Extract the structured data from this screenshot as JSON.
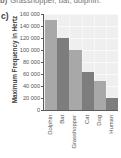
{
  "previous_item": {
    "label": "b)",
    "text": "Grasshopper, bat, dolphin."
  },
  "panel": {
    "letter": "c)"
  },
  "chart_data": {
    "type": "bar",
    "title": "",
    "xlabel": "",
    "ylabel": "Maximum Frequency in Hertz",
    "categories": [
      "Dolphin",
      "Bat",
      "Grasshopper",
      "Cat",
      "Dog",
      "Human"
    ],
    "values": [
      150000,
      120000,
      100000,
      64000,
      48000,
      20000
    ],
    "bar_colors": [
      "#a8a8a8",
      "#7d7d7d",
      "#a8a8a8",
      "#7d7d7d",
      "#a8a8a8",
      "#7d7d7d"
    ],
    "ylim": [
      0,
      160000
    ],
    "ytick_values": [
      160000,
      140000,
      120000,
      100000,
      80000,
      60000,
      40000,
      20000,
      0
    ],
    "ytick_labels": [
      "160 000",
      "140 000",
      "120 000",
      "100 000",
      "80 000",
      "60 000",
      "40 000",
      "20 000",
      "0"
    ],
    "grid": true,
    "grid_axis": "y",
    "legend": false,
    "plot_background": "#efeff0",
    "axis_color": "#5a5a5a"
  }
}
